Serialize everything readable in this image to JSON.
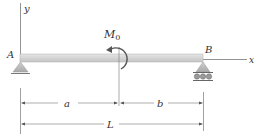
{
  "diagram": {
    "type": "simply-supported-beam",
    "labels": {
      "y_axis": "y",
      "x_axis": "x",
      "support_left": "A",
      "support_right": "B",
      "moment": "M",
      "moment_subscript": "0",
      "dim_a": "a",
      "dim_b": "b",
      "dim_L": "L"
    },
    "supports": {
      "left": "pin",
      "right": "roller"
    },
    "moment_direction": "counterclockwise",
    "colors": {
      "beam_fill": "#d9d9d9",
      "beam_edge": "#a8a8a8",
      "line": "#555555",
      "support_fill": "#bdbdbd",
      "text": "#333333"
    }
  }
}
